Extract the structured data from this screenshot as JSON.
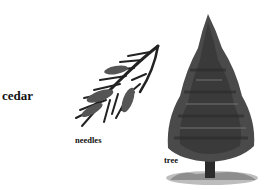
{
  "word": "cedar",
  "illustrations": [
    {
      "name": "needles",
      "label": "needles"
    },
    {
      "name": "tree",
      "label": "tree"
    }
  ],
  "colors": {
    "background": "#ffffff",
    "ink": "#111111",
    "foliage": "#3a3a3a",
    "ground": "#9a9a9a"
  }
}
